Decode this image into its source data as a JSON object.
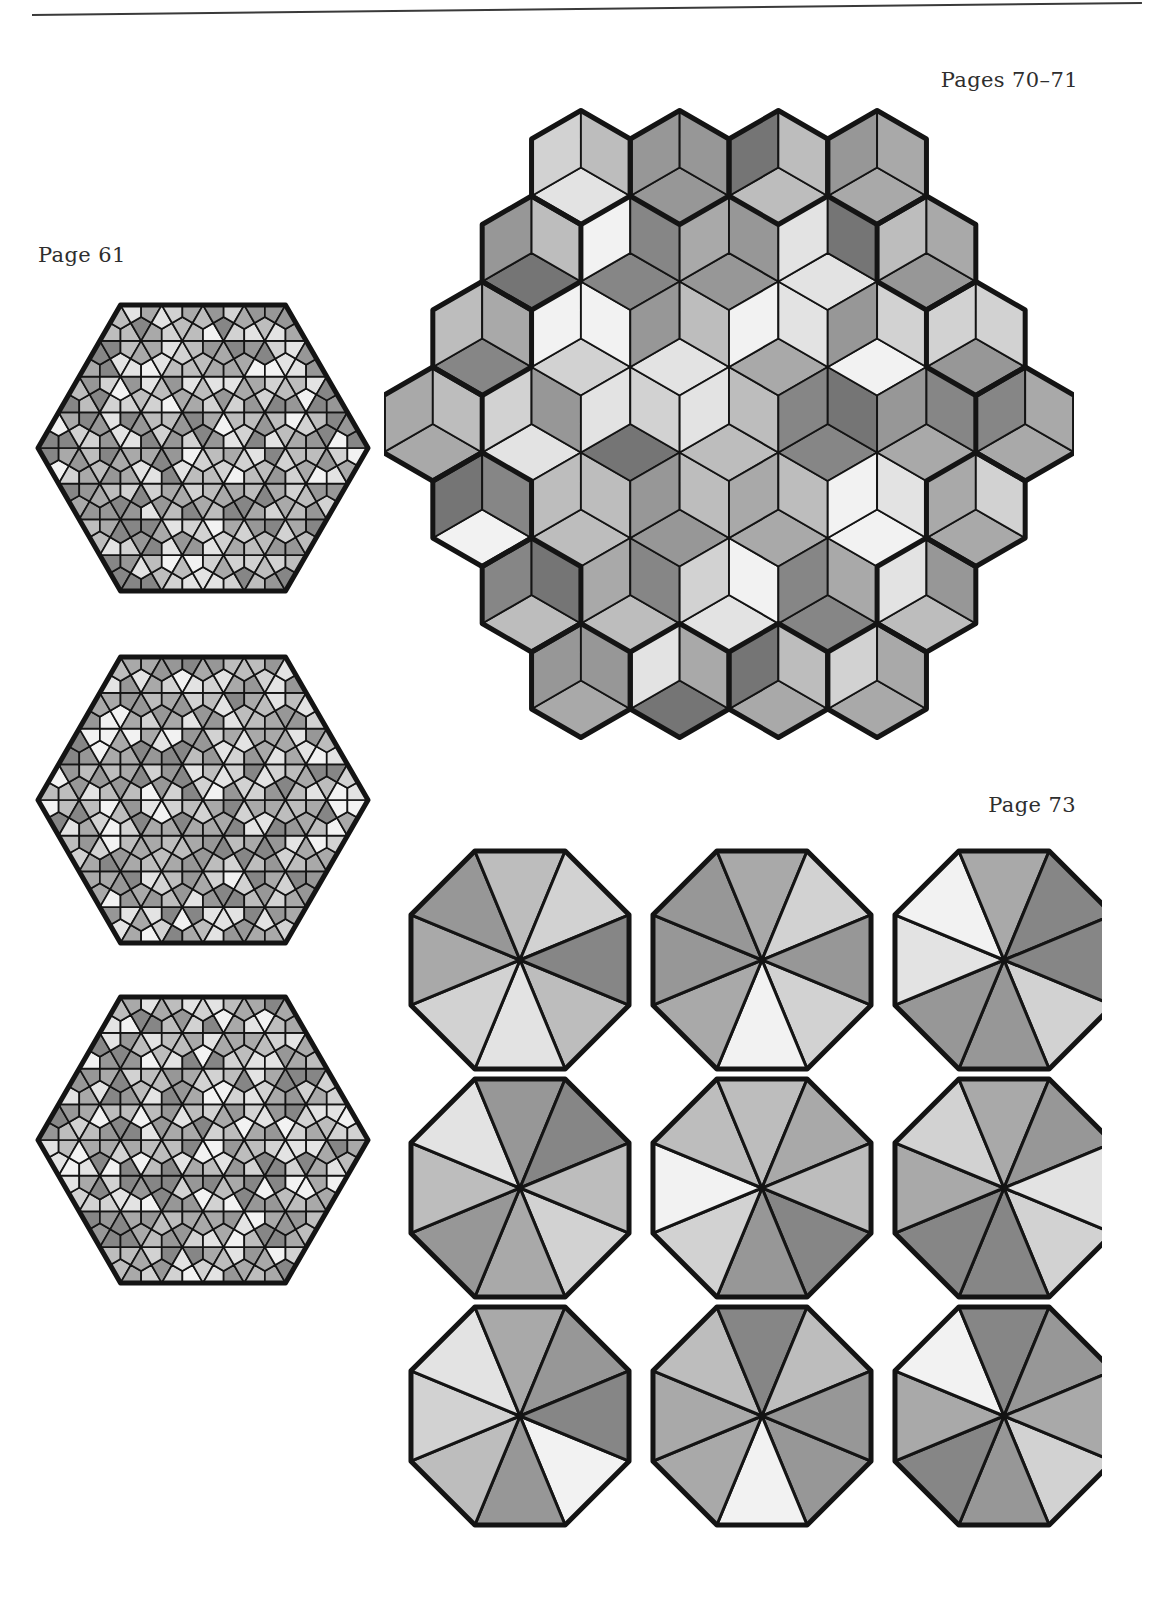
{
  "page": {
    "background": "#ffffff",
    "rule_color": "#3a3a3a",
    "ink": "#1a1a1a"
  },
  "labels": {
    "pages_70_71": "Pages 70–71",
    "page_61": "Page 61",
    "page_73": "Page 73"
  },
  "palette": {
    "p0": "#f2f2f2",
    "p1": "#e3e3e3",
    "p2": "#d2d2d2",
    "p3": "#bdbdbd",
    "p4": "#a9a9a9",
    "p5": "#979797",
    "p6": "#868686",
    "p7": "#757575",
    "outline": "#141414"
  },
  "chart_data": [
    {
      "type": "diagram",
      "name": "hexagon-triangle-tiling-1",
      "title": "Page 61 — hexagon variant 1",
      "shape": "hexagon",
      "grid": "triangular grid, each triangle split into 3 kites from centroid",
      "rows": 4,
      "tones": [
        "p7",
        "p5",
        "p3",
        "p1",
        "p0"
      ]
    },
    {
      "type": "diagram",
      "name": "hexagon-triangle-tiling-2",
      "title": "Page 61 — hexagon variant 2",
      "shape": "hexagon",
      "grid": "triangular grid, each triangle split into 3 kites from centroid",
      "rows": 4,
      "tones": [
        "p7",
        "p5",
        "p3",
        "p1",
        "p0"
      ]
    },
    {
      "type": "diagram",
      "name": "hexagon-triangle-tiling-3",
      "title": "Page 61 — hexagon variant 3",
      "shape": "hexagon",
      "grid": "triangular grid, each triangle split into 3 kites from centroid",
      "rows": 4,
      "tones": [
        "p7",
        "p5",
        "p3",
        "p1",
        "p0"
      ]
    },
    {
      "type": "diagram",
      "name": "rhombille-tiling",
      "title": "Pages 70–71 — rhombille (cube) tiling",
      "shape": "stepped hexagonal star outline",
      "unit": "60° rhombus in three orientations",
      "rhombus_count": 84,
      "tones": [
        "p0",
        "p1",
        "p2",
        "p3",
        "p4",
        "p5",
        "p6",
        "p7"
      ]
    },
    {
      "type": "diagram",
      "name": "octagon-wedge-grid",
      "title": "Page 73 — nine octagons",
      "shape": "regular octagon",
      "rows": 3,
      "cols": 3,
      "wedges_per_octagon": 8,
      "octagons": [
        {
          "id": 1,
          "wedges": [
            "p3",
            "p1",
            "p2",
            "p4",
            "p5",
            "p3",
            "p2",
            "p6"
          ]
        },
        {
          "id": 2,
          "wedges": [
            "p2",
            "p0",
            "p4",
            "p5",
            "p5",
            "p4",
            "p2",
            "p5"
          ]
        },
        {
          "id": 3,
          "wedges": [
            "p2",
            "p5",
            "p5",
            "p1",
            "p0",
            "p4",
            "p6",
            "p6"
          ]
        },
        {
          "id": 4,
          "wedges": [
            "p2",
            "p4",
            "p5",
            "p3",
            "p1",
            "p5",
            "p6",
            "p3"
          ]
        },
        {
          "id": 5,
          "wedges": [
            "p6",
            "p5",
            "p2",
            "p0",
            "p3",
            "p3",
            "p4",
            "p3"
          ]
        },
        {
          "id": 6,
          "wedges": [
            "p2",
            "p6",
            "p6",
            "p4",
            "p2",
            "p4",
            "p5",
            "p1"
          ]
        },
        {
          "id": 7,
          "wedges": [
            "p0",
            "p5",
            "p3",
            "p2",
            "p1",
            "p4",
            "p5",
            "p6"
          ]
        },
        {
          "id": 8,
          "wedges": [
            "p5",
            "p0",
            "p4",
            "p4",
            "p3",
            "p6",
            "p3",
            "p5"
          ]
        },
        {
          "id": 9,
          "wedges": [
            "p2",
            "p5",
            "p6",
            "p4",
            "p0",
            "p6",
            "p5",
            "p4"
          ]
        }
      ]
    }
  ]
}
